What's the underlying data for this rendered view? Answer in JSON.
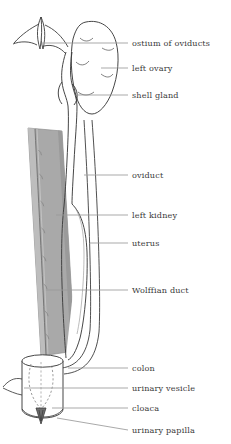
{
  "figure": {
    "name": "female-urogenital-system-diagram",
    "background_color": "#ffffff",
    "stroke_color": "#3c3c3c",
    "leader_line_color": "#9a9a9a",
    "kidney_fill_color": "#a9a9a9",
    "kidney_edge_color": "#8a8a8a",
    "label_text_color": "#3a3a3a"
  },
  "labels": [
    {
      "id": "ostium-of-oviducts",
      "text": "ostium of oviducts",
      "x": 132,
      "y": 39,
      "leader": {
        "x1": 128,
        "y1": 43,
        "x2": 41,
        "y2": 43
      }
    },
    {
      "id": "left-ovary",
      "text": "left ovary",
      "x": 132,
      "y": 64,
      "leader": {
        "x1": 128,
        "y1": 68,
        "x2": 101,
        "y2": 68
      }
    },
    {
      "id": "shell-gland",
      "text": "shell gland",
      "x": 132,
      "y": 91,
      "leader": {
        "x1": 128,
        "y1": 95,
        "x2": 77,
        "y2": 95
      }
    },
    {
      "id": "oviduct",
      "text": "oviduct",
      "x": 132,
      "y": 171,
      "leader": {
        "x1": 128,
        "y1": 175,
        "x2": 84,
        "y2": 175
      }
    },
    {
      "id": "left-kidney",
      "text": "left kidney",
      "x": 132,
      "y": 211,
      "leader": {
        "x1": 128,
        "y1": 215,
        "x2": 56,
        "y2": 215
      }
    },
    {
      "id": "uterus",
      "text": "uterus",
      "x": 132,
      "y": 239,
      "leader": {
        "x1": 128,
        "y1": 243,
        "x2": 90,
        "y2": 243
      }
    },
    {
      "id": "wolffian-duct",
      "text": "Wolffian duct",
      "x": 132,
      "y": 286,
      "leader": {
        "x1": 128,
        "y1": 290,
        "x2": 46,
        "y2": 290
      }
    },
    {
      "id": "colon",
      "text": "colon",
      "x": 132,
      "y": 364,
      "leader": {
        "x1": 128,
        "y1": 368,
        "x2": 68,
        "y2": 368
      }
    },
    {
      "id": "urinary-vesicle",
      "text": "urinary vesicle",
      "x": 132,
      "y": 384,
      "leader": {
        "x1": 128,
        "y1": 388,
        "x2": 24,
        "y2": 388
      }
    },
    {
      "id": "cloaca",
      "text": "cloaca",
      "x": 132,
      "y": 404,
      "leader": {
        "x1": 128,
        "y1": 408,
        "x2": 52,
        "y2": 408
      }
    },
    {
      "id": "urinary-papilla",
      "text": "urinary papilla",
      "x": 132,
      "y": 426,
      "leader": {
        "x1": 128,
        "y1": 430,
        "x2": 57,
        "y2": 418
      }
    }
  ],
  "structures": {
    "ostium_funnel": "funnel-shaped opening at upper left of oviduct",
    "left_ovary": "large lobed ovoid body right of upper oviduct",
    "shell_gland": "swelling of the oviduct below the ovary",
    "oviduct": "long narrow paired tube descending the midline",
    "left_kidney": "elongated grey wedge along the left side",
    "uterus": "wide fusiform expansion of the lower oviduct",
    "wolffian_duct": "fine duct running down the face of the kidney",
    "colon": "tube curving left into the cloaca",
    "urinary_vesicle": "dashed sac inside the cloaca",
    "cloaca": "terminal cylindrical chamber",
    "urinary_papilla": "small pointed projection at the cloacal floor"
  }
}
